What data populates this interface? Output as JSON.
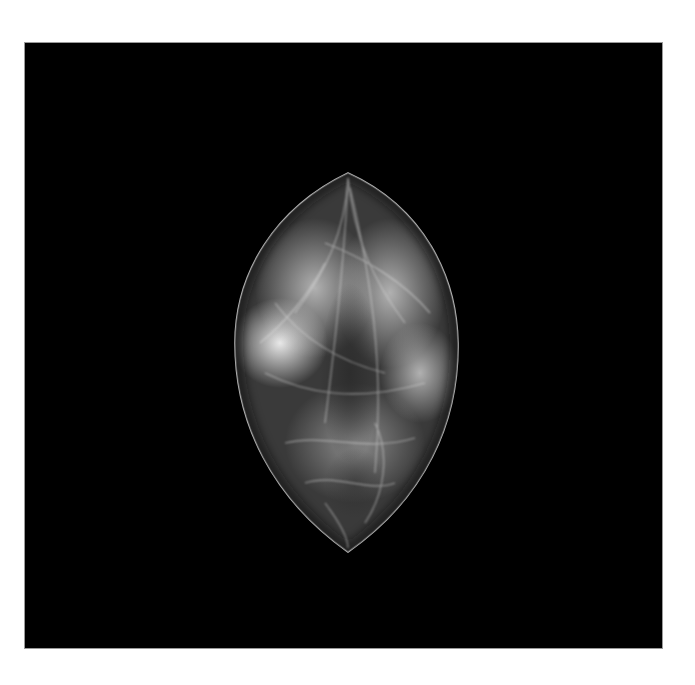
{
  "image": {
    "kind": "grayscale radiograph (mammogram)",
    "background_color": "#ffffff",
    "panel_color": "#000000",
    "tissue_colors": {
      "bright": "#e6e6e6",
      "mid": "#8a8a8a",
      "dark": "#2a2a2a",
      "skin_line": "#b0b0b0"
    }
  }
}
